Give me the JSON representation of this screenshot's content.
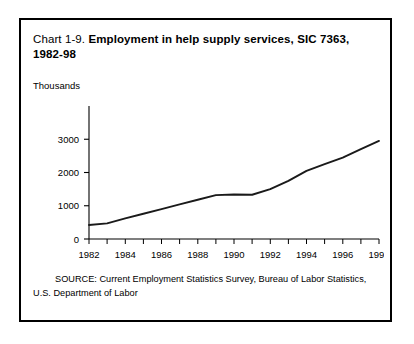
{
  "figure": {
    "title_prefix": "Chart 1-9. ",
    "title_main": "Employment in help supply services, SIC 7363, 1982-98",
    "source_line_1": "SOURCE: Current Employment Statistics Survey, Bureau of Labor Statistics,",
    "source_line_2": "U.S. Department of Labor",
    "unit_label": "Thousands",
    "line_color": "#1a1a1a",
    "axis_color": "#000000",
    "border_color": "#000000",
    "background_color": "#ffffff"
  },
  "chart_data": {
    "type": "line",
    "title": "Chart 1-9. Employment in help supply services, SIC 7363, 1982-98",
    "xlabel": "",
    "ylabel": "Thousands",
    "xlim": [
      1982,
      1998
    ],
    "ylim": [
      0,
      3200
    ],
    "yticks": [
      0,
      1000,
      2000,
      3000
    ],
    "ytick_labels": [
      "0",
      "1000",
      "2000",
      "3000"
    ],
    "xticks": [
      1982,
      1983,
      1984,
      1985,
      1986,
      1987,
      1988,
      1989,
      1990,
      1991,
      1992,
      1993,
      1994,
      1995,
      1996,
      1997,
      1998
    ],
    "xtick_labels_shown": [
      "1982",
      "1984",
      "1986",
      "1988",
      "1990",
      "1992",
      "1994",
      "1996",
      "1998"
    ],
    "grid": false,
    "legend": false,
    "x": [
      1982,
      1983,
      1984,
      1985,
      1986,
      1987,
      1988,
      1989,
      1990,
      1991,
      1992,
      1993,
      1994,
      1995,
      1996,
      1997,
      1998
    ],
    "values": [
      420,
      470,
      620,
      760,
      900,
      1040,
      1180,
      1320,
      1340,
      1330,
      1500,
      1750,
      2050,
      2250,
      2450,
      2700,
      2950
    ],
    "series": [
      {
        "name": "Help supply services employment",
        "values": [
          420,
          470,
          620,
          760,
          900,
          1040,
          1180,
          1320,
          1340,
          1330,
          1500,
          1750,
          2050,
          2250,
          2450,
          2700,
          2950
        ]
      }
    ]
  }
}
